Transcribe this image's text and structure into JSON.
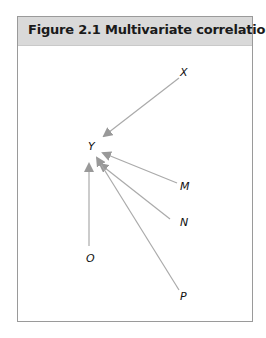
{
  "figure": {
    "title": "Figure 2.1  Multivariate correlation"
  },
  "diagram": {
    "arrow_color": "#999999",
    "nodes": [
      {
        "id": "X",
        "label": "X",
        "x": 183,
        "y": 72
      },
      {
        "id": "Y",
        "label": "Y",
        "x": 92,
        "y": 146
      },
      {
        "id": "M",
        "label": "M",
        "x": 183,
        "y": 186
      },
      {
        "id": "N",
        "label": "N",
        "x": 183,
        "y": 222
      },
      {
        "id": "O",
        "label": "O",
        "x": 88,
        "y": 258
      },
      {
        "id": "P",
        "label": "P",
        "x": 183,
        "y": 296
      }
    ],
    "edges": [
      {
        "from": "X",
        "to": "Y"
      },
      {
        "from": "M",
        "to": "Y"
      },
      {
        "from": "N",
        "to": "Y"
      },
      {
        "from": "O",
        "to": "Y"
      },
      {
        "from": "P",
        "to": "Y"
      }
    ]
  }
}
